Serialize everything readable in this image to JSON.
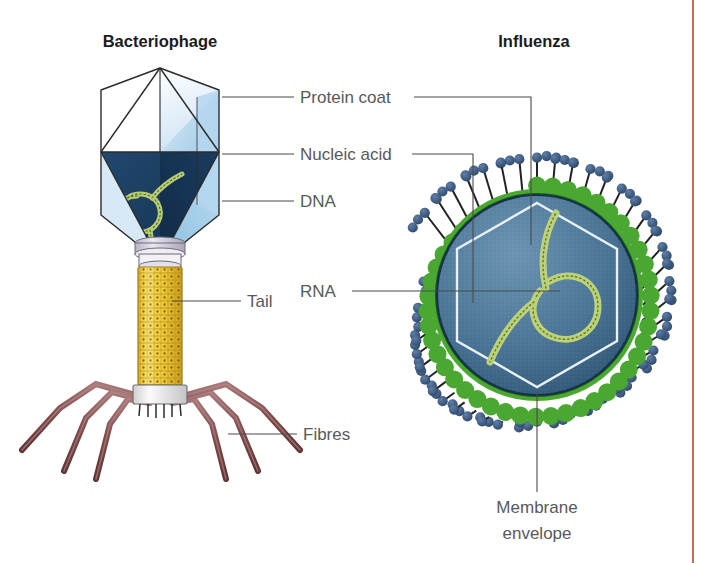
{
  "figure": {
    "background_color": "#ffffff",
    "width": 709,
    "height": 563,
    "right_rule_color": "#c0442a"
  },
  "panels": [
    {
      "id": "bacteriophage",
      "title": "Bacteriophage",
      "title_x": 160,
      "title_y": 47
    },
    {
      "id": "influenza",
      "title": "Influenza",
      "title_x": 534,
      "title_y": 47
    }
  ],
  "labels": [
    {
      "id": "protein-coat",
      "text": "Protein coat",
      "x": 300,
      "y": 103,
      "anchor": "start",
      "leader_left": {
        "x1": 294,
        "y1": 97,
        "x2": 222,
        "y2": 97
      },
      "leader_right": {
        "x1": 414,
        "y1": 97,
        "x2": 531,
        "y2": 97,
        "down_to_y": 240
      }
    },
    {
      "id": "nucleic-acid",
      "text": "Nucleic acid",
      "x": 300,
      "y": 160,
      "anchor": "start",
      "leader_left": {
        "x1": 294,
        "y1": 154,
        "x2": 222,
        "y2": 154
      },
      "leader_right": {
        "x1": 410,
        "y1": 154,
        "x2": 473,
        "y2": 154,
        "down_to_y": 302
      }
    },
    {
      "id": "dna",
      "text": "DNA",
      "x": 300,
      "y": 207,
      "anchor": "start",
      "leader_left": {
        "x1": 294,
        "y1": 201,
        "x2": 222,
        "y2": 201
      }
    },
    {
      "id": "rna",
      "text": "RNA",
      "x": 300,
      "y": 297,
      "anchor": "start",
      "leader_right": {
        "x1": 352,
        "y1": 291,
        "x2": 545,
        "y2": 291
      }
    },
    {
      "id": "tail",
      "text": "Tail",
      "x": 247,
      "y": 307,
      "anchor": "start",
      "leader_left": {
        "x1": 241,
        "y1": 301,
        "x2": 172,
        "y2": 301
      }
    },
    {
      "id": "fibres",
      "text": "Fibres",
      "x": 303,
      "y": 440,
      "anchor": "start",
      "leader_left": {
        "x1": 297,
        "y1": 434,
        "x2": 228,
        "y2": 434
      }
    },
    {
      "id": "membrane-envelope",
      "text": "Membrane",
      "text_line2": "envelope",
      "x": 537,
      "y": 513,
      "anchor": "middle",
      "leader_vertical": {
        "x": 537,
        "y1": 390,
        "y2": 492
      }
    }
  ],
  "colors": {
    "capsid_light": "#ffffff",
    "capsid_pale_blue": "#d7e9f7",
    "capsid_mid_blue": "#a9cfe8",
    "capsid_dark_navy": "#1c3f66",
    "capsid_darker_navy": "#16324f",
    "capsid_outline": "#2b2b2b",
    "dna_strand": "#a8bf5e",
    "dna_strand_light": "#c9d98c",
    "tail_yellow": "#f5cf3b",
    "tail_yellow_dark": "#cda01f",
    "collar_grey": "#cfcbd8",
    "baseplate_white": "#f2f2f2",
    "fibre_brown": "#7d4a4a",
    "fibre_brown_light": "#a87878",
    "envelope_green": "#4aa832",
    "envelope_green_dark": "#2f7d1e",
    "capsid_sphere_blue": "#4a7596",
    "capsid_sphere_blue_dark": "#2e5472",
    "spike_stem": "#232323",
    "spike_head": "#3f5f8a",
    "spike_head_dark": "#2c4566",
    "hexagon_line": "#e8f0f8",
    "rna_green": "#b6c96a"
  },
  "structures": {
    "bacteriophage": {
      "head_type": "icosahedral-capsid",
      "head_center_x": 160,
      "head_center_y": 152,
      "tail_type": "contractile-sheath",
      "tail_x": 160,
      "tail_top_y": 250,
      "tail_bottom_y": 400,
      "fibre_count": 6,
      "dna_loop_description": "circular double-stranded DNA coil inside lower capsid"
    },
    "influenza": {
      "shape": "enveloped-sphere",
      "center_x": 537,
      "center_y": 295,
      "radius": 106,
      "spike_count": 42,
      "spike_head_balls": 3,
      "inner_hexagon": true,
      "rna_description": "single looped RNA strand with helical ticks inside capsid"
    }
  }
}
